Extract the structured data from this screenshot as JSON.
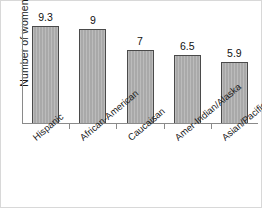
{
  "chart_data": {
    "type": "bar",
    "title": "",
    "xlabel": "",
    "ylabel": "Number of women",
    "categories": [
      "Hispanic",
      "African-American",
      "Caucaisan",
      "Amer-Indian/Alaska",
      "Asian/Pacific Island"
    ],
    "values": [
      9.3,
      9,
      7,
      6.5,
      5.9
    ],
    "value_labels": [
      "9.3",
      "9",
      "7",
      "6.5",
      "5.9"
    ],
    "ylim": [
      0,
      10.2
    ],
    "grid": false,
    "legend": "none",
    "y_tick_labels": [],
    "bar_color": "#a9a9a9",
    "bar_border_color": "#4a4a4a",
    "axis_color": "#8a8a8a",
    "text_color": "#1a1a1a",
    "label_rotation_deg": -40
  }
}
